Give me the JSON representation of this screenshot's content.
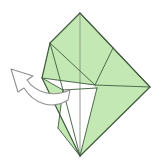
{
  "document": {
    "type": "origami-instruction-diagram",
    "title": "Origami fold step diagram",
    "canvas": {
      "width": 162,
      "height": 168,
      "background": "#ffffff"
    }
  },
  "palette": {
    "paper_front": "#c3e8b4",
    "paper_front_shade": "#b6e0a4",
    "paper_back": "#ffffff",
    "fold_line": "#4d6b4a",
    "edge_line": "#3f5a3e",
    "crease_line": "#7a8f78",
    "arrow_fill": "#ffffff",
    "arrow_stroke": "#8f8f8f"
  },
  "figure": {
    "name": "folded-paper-model",
    "vertices": {
      "top_apex": [
        80,
        13
      ],
      "right_corner": [
        150,
        87
      ],
      "bottom_point": [
        80,
        156
      ],
      "left_upper": [
        50,
        43
      ],
      "left_lower": [
        42,
        78
      ],
      "inner_right": [
        113,
        48
      ],
      "inner_center": [
        95,
        85
      ],
      "flap_left": [
        63,
        90
      ],
      "flap_right": [
        97,
        88
      ],
      "lower_left": [
        58,
        128
      ]
    },
    "faces": [
      {
        "name": "upper-left-green-panel",
        "fill": "paper_front",
        "points": "80,13 50,43 42,78 95,85 113,48"
      },
      {
        "name": "upper-right-green-panel",
        "fill": "paper_front",
        "points": "80,13 113,48 150,87 95,85"
      },
      {
        "name": "lower-right-green-panel",
        "fill": "paper_front",
        "points": "95,85 150,87 80,156"
      },
      {
        "name": "lower-left-green-panel",
        "fill": "paper_front",
        "points": "42,78 63,90 58,128 80,156"
      },
      {
        "name": "inner-white-flap",
        "fill": "paper_back",
        "points": "63,90 97,88 80,156"
      }
    ],
    "creases": [
      {
        "name": "center-vertical-crease",
        "from": [
          80,
          13
        ],
        "to": [
          80,
          156
        ]
      },
      {
        "name": "left-diagonal-crease",
        "from": [
          50,
          43
        ],
        "to": [
          95,
          85
        ]
      },
      {
        "name": "left-lower-crease",
        "from": [
          42,
          78
        ],
        "to": [
          95,
          85
        ]
      },
      {
        "name": "right-diagonal-crease",
        "from": [
          113,
          48
        ],
        "to": [
          95,
          85
        ]
      },
      {
        "name": "right-upper-crease",
        "from": [
          80,
          13
        ],
        "to": [
          113,
          48
        ]
      },
      {
        "name": "inner-left-crease",
        "from": [
          50,
          43
        ],
        "to": [
          63,
          90
        ]
      },
      {
        "name": "flap-left-edge",
        "from": [
          63,
          90
        ],
        "to": [
          80,
          156
        ]
      },
      {
        "name": "flap-right-edge",
        "from": [
          97,
          88
        ],
        "to": [
          80,
          156
        ]
      },
      {
        "name": "lower-left-edge",
        "from": [
          58,
          128
        ],
        "to": [
          80,
          156
        ]
      },
      {
        "name": "lower-left-upper-edge",
        "from": [
          63,
          90
        ],
        "to": [
          58,
          128
        ]
      },
      {
        "name": "short-left-fold",
        "from": [
          42,
          78
        ],
        "to": [
          63,
          90
        ]
      }
    ],
    "outline": "80,13 150,87 80,156 42,78 50,43"
  },
  "arrow": {
    "name": "pull-out-arrow",
    "label": "",
    "direction": "up-left",
    "meaning": "pull the inner flap outward to the left",
    "tail": [
      68,
      103
    ],
    "head": [
      12,
      70
    ],
    "fill": "#ffffff",
    "stroke": "#8f8f8f",
    "path": "M 68,100 C 52,110 34,104 24,88 L 18,92 L 11,69 L 33,76 L 27,80 C 35,92 52,98 70,90 Z"
  }
}
